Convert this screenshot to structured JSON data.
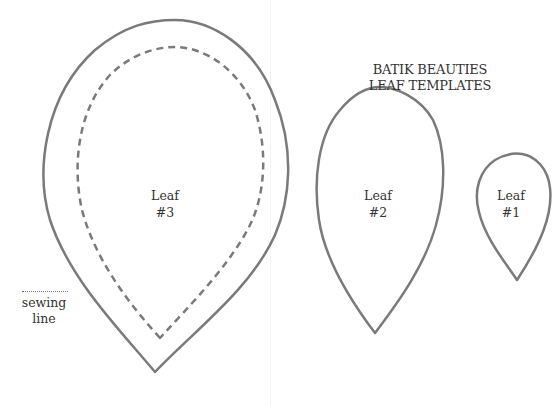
{
  "title": {
    "line1": "BATIK BEAUTIES",
    "line2": "LEAF TEMPLATES"
  },
  "leaves": [
    {
      "id": "leaf-3",
      "label_line1": "Leaf",
      "label_line2": "#3",
      "has_sewing_line": true
    },
    {
      "id": "leaf-2",
      "label_line1": "Leaf",
      "label_line2": "#2",
      "has_sewing_line": false
    },
    {
      "id": "leaf-1",
      "label_line1": "Leaf",
      "label_line2": "#1",
      "has_sewing_line": false
    }
  ],
  "legend": {
    "sewing_line_line1": "sewing",
    "sewing_line_line2": "line"
  },
  "colors": {
    "outline": "#7a7a7a",
    "text": "#333333",
    "background": "#ffffff"
  }
}
